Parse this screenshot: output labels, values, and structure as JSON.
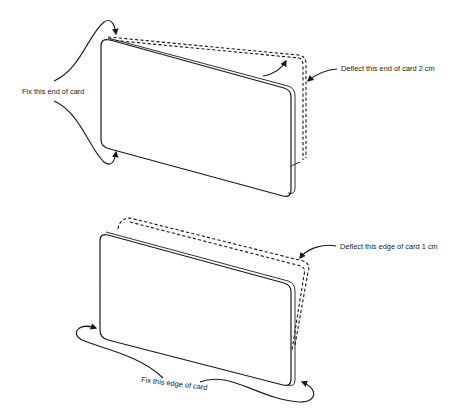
{
  "figure": {
    "type": "technical-illustration",
    "panels": [
      {
        "id": "top",
        "labels": {
          "fixed": "Fix this end of card",
          "deflect": "Deflect this end of card 2 cm"
        }
      },
      {
        "id": "bottom",
        "labels": {
          "fixed": "Fix this edge of card",
          "deflect": "Deflect this edge of card 1 cm"
        }
      }
    ],
    "colors": {
      "line": "#1a1a1a",
      "background": "#ffffff"
    }
  }
}
